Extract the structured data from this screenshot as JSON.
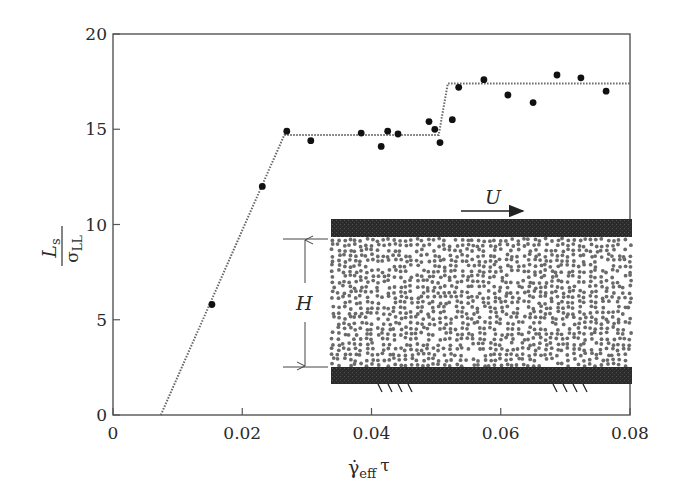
{
  "chart_data": {
    "type": "scatter",
    "title": "",
    "xlabel": "γ̇_eff τ",
    "ylabel": "L_s / σ_LL",
    "xlim": [
      0,
      0.08
    ],
    "ylim": [
      0,
      20
    ],
    "grid": false,
    "x_ticks": [
      "0",
      "0.02",
      "0.04",
      "0.06",
      "0.08"
    ],
    "y_ticks": [
      "0",
      "5",
      "10",
      "15",
      "20"
    ],
    "series": [
      {
        "name": "simulation data",
        "marker": "filled-circle",
        "x": [
          0.0153,
          0.0231,
          0.0269,
          0.0306,
          0.0384,
          0.0415,
          0.0425,
          0.0441,
          0.0489,
          0.0498,
          0.0506,
          0.0525,
          0.0535,
          0.0574,
          0.0611,
          0.065,
          0.0687,
          0.0724,
          0.0763
        ],
        "y": [
          5.8,
          12.0,
          14.9,
          14.4,
          14.8,
          14.1,
          14.9,
          14.75,
          15.4,
          15.0,
          14.3,
          15.5,
          17.2,
          17.6,
          16.8,
          16.4,
          17.85,
          17.7,
          17.0
        ]
      },
      {
        "name": "guide line",
        "style": "dotted",
        "x": [
          0.0074,
          0.0265,
          0.0504,
          0.0518,
          0.08
        ],
        "y": [
          0,
          14.7,
          14.7,
          17.4,
          17.4
        ]
      }
    ],
    "annotations": [
      "U",
      "H"
    ],
    "inset": "Sheared fluid between two walls; top wall moves with velocity U (arrow), bottom wall fixed (hatch marks); H is the gap height"
  },
  "labels": {
    "ylabel_num": "L",
    "ylabel_num_sub": "s",
    "ylabel_den": "σ",
    "ylabel_den_sub": "LL",
    "xlabel_main": "γ̇",
    "xlabel_sub": "eff",
    "xlabel_tau": "τ",
    "inset_U": "U",
    "inset_H": "H"
  }
}
